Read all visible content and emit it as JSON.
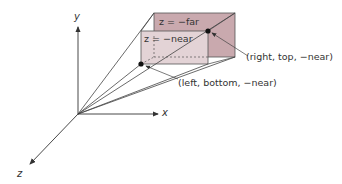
{
  "diagram": {
    "axes": {
      "x": "x",
      "y": "y",
      "z": "z"
    },
    "planes": {
      "far": "z = −far",
      "near": "z = −near"
    },
    "callouts": {
      "top_right": "(right, top, −near)",
      "bottom_left": "(left, bottom, −near)"
    },
    "colors": {
      "far_fill": "#c9a9ae",
      "near_fill": "#e3d3d6",
      "line": "#444444"
    }
  }
}
